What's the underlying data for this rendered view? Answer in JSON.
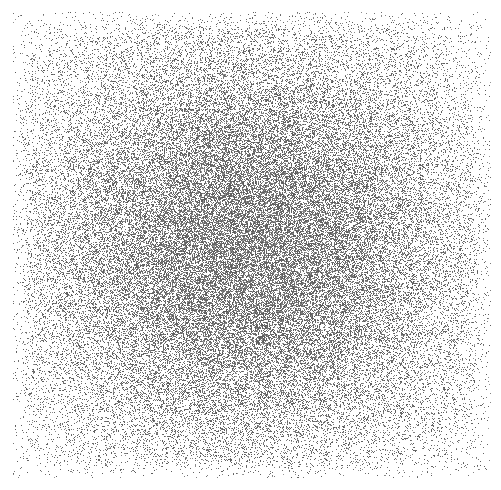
{
  "image": {
    "kind": "stipple-noise-field",
    "description": "Random pixel stipple whose dot density forms a soft radial blob, densest at the center and fading to white toward the edges and corners",
    "width": 501,
    "height": 490,
    "background_color": "#ffffff",
    "dot_color": "#5a5a5a",
    "dot_color_light": "#9a9a9a",
    "dot_size_px": 1
  },
  "field": {
    "region_left": 13,
    "region_top": 12,
    "region_right": 490,
    "region_bottom": 477,
    "center_x": 248,
    "center_y": 243,
    "peak_density": 0.62,
    "edge_density": 0.035,
    "corner_density": 0.012,
    "falloff_type": "gaussian",
    "sigma_x": 132,
    "sigma_y": 128,
    "edge_feather_px": 26,
    "grain_seed": 20240917
  },
  "chart_data": {
    "type": "heatmap",
    "title": "",
    "xlabel": "",
    "ylabel": "",
    "xlim": [
      13,
      490
    ],
    "ylim": [
      12,
      477
    ],
    "grid": false,
    "legend": "none",
    "value_label": "stipple dot density",
    "radial_profile": {
      "radius_px": [
        0,
        30,
        60,
        90,
        120,
        150,
        180,
        210,
        240,
        270,
        300
      ],
      "density": [
        0.62,
        0.58,
        0.49,
        0.38,
        0.27,
        0.18,
        0.11,
        0.07,
        0.04,
        0.025,
        0.015
      ]
    },
    "horizontal_profile": {
      "x": [
        13,
        60,
        110,
        160,
        200,
        248,
        300,
        350,
        400,
        445,
        490
      ],
      "density": [
        0.03,
        0.07,
        0.15,
        0.29,
        0.45,
        0.62,
        0.44,
        0.27,
        0.13,
        0.06,
        0.03
      ]
    },
    "vertical_profile": {
      "y": [
        12,
        60,
        110,
        160,
        200,
        243,
        290,
        340,
        390,
        435,
        477
      ],
      "density": [
        0.03,
        0.07,
        0.16,
        0.31,
        0.47,
        0.62,
        0.45,
        0.28,
        0.14,
        0.06,
        0.03
      ]
    }
  }
}
